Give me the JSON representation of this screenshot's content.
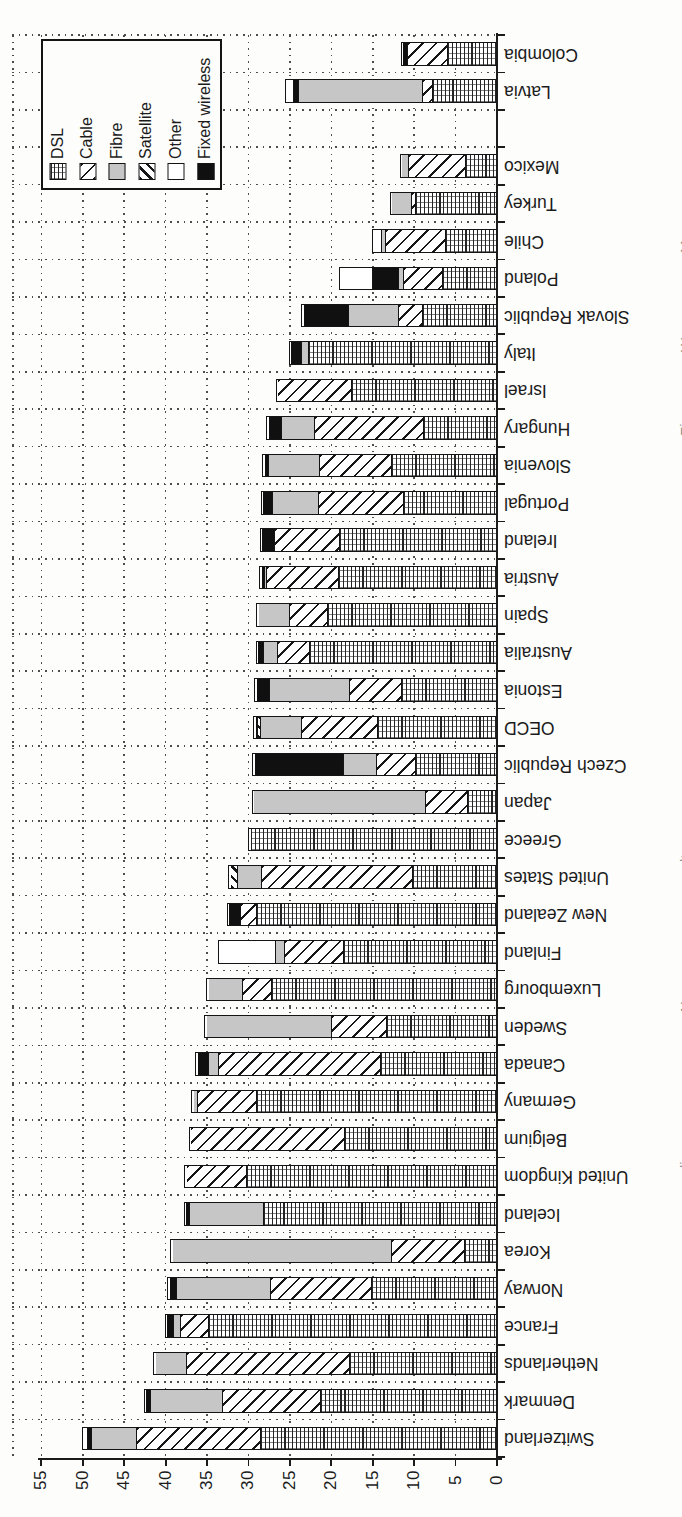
{
  "legend": {
    "entries": [
      {
        "label": "DSL",
        "key": "dsl"
      },
      {
        "label": "Cable",
        "key": "cable"
      },
      {
        "label": "Fibre",
        "key": "fibre"
      },
      {
        "label": "Satellite",
        "key": "satellite"
      },
      {
        "label": "Other",
        "key": "other"
      },
      {
        "label": "Fixed wireless",
        "key": "fixed_wireless"
      }
    ]
  },
  "value_axis": {
    "min": 0,
    "max": 55,
    "tick_step": 5,
    "tick_labels": [
      "55",
      "50",
      "45",
      "40",
      "35",
      "30",
      "25",
      "20",
      "15",
      "10",
      "5",
      "0"
    ]
  },
  "chart_data": {
    "type": "bar",
    "stacked": true,
    "orientation": "rotated-90ccw (bars extend left from right baseline, countries top-to-bottom)",
    "grid": "dotted, both axes",
    "legend_position": "top-left box",
    "series_order": [
      "dsl",
      "cable",
      "fibre",
      "satellite",
      "fixed_wireless",
      "other"
    ],
    "rows": [
      {
        "label": "Colombia",
        "segments": {
          "dsl": 5.8,
          "cable": 4.8,
          "fibre": 0,
          "satellite": 0,
          "fixed_wireless": 0.6,
          "other": 0
        }
      },
      {
        "label": "Latvia",
        "segments": {
          "dsl": 7.6,
          "cable": 1.2,
          "fibre": 15.0,
          "satellite": 0,
          "fixed_wireless": 0.6,
          "other": 0.8
        }
      },
      {
        "gap": true,
        "label": ""
      },
      {
        "label": "Mexico",
        "segments": {
          "dsl": 3.6,
          "cable": 6.9,
          "fibre": 0.8,
          "satellite": 0,
          "fixed_wireless": 0,
          "other": 0
        }
      },
      {
        "label": "Turkey",
        "segments": {
          "dsl": 9.6,
          "cable": 0.6,
          "fibre": 2.3,
          "satellite": 0,
          "fixed_wireless": 0,
          "other": 0
        }
      },
      {
        "label": "Chile",
        "segments": {
          "dsl": 6.0,
          "cable": 7.3,
          "fibre": 0.5,
          "satellite": 0,
          "fixed_wireless": 0,
          "other": 0.8
        }
      },
      {
        "label": "Poland",
        "segments": {
          "dsl": 6.4,
          "cable": 4.7,
          "fibre": 0.6,
          "satellite": 0,
          "fixed_wireless": 3.1,
          "other": 3.9
        }
      },
      {
        "label": "Slovak Republic",
        "segments": {
          "dsl": 8.8,
          "cable": 2.9,
          "fibre": 6.0,
          "satellite": 0,
          "fixed_wireless": 5.5,
          "other": 0
        }
      },
      {
        "label": "Italy",
        "segments": {
          "dsl": 22.6,
          "cable": 0,
          "fibre": 0.8,
          "satellite": 0,
          "fixed_wireless": 1.3,
          "other": 0
        }
      },
      {
        "label": "Israel",
        "segments": {
          "dsl": 17.4,
          "cable": 8.9,
          "fibre": 0,
          "satellite": 0,
          "fixed_wireless": 0,
          "other": 0
        }
      },
      {
        "label": "Hungary",
        "segments": {
          "dsl": 8.7,
          "cable": 13.2,
          "fibre": 3.9,
          "satellite": 0,
          "fixed_wireless": 1.6,
          "other": 0
        }
      },
      {
        "label": "Slovenia",
        "segments": {
          "dsl": 12.6,
          "cable": 8.7,
          "fibre": 6.1,
          "satellite": 0,
          "fixed_wireless": 0.5,
          "other": 0
        }
      },
      {
        "label": "Portugal",
        "segments": {
          "dsl": 11.1,
          "cable": 10.3,
          "fibre": 5.5,
          "satellite": 0,
          "fixed_wireless": 1.2,
          "other": 0
        }
      },
      {
        "label": "Ireland",
        "segments": {
          "dsl": 18.8,
          "cable": 7.9,
          "fibre": 0,
          "satellite": 0,
          "fixed_wireless": 1.5,
          "other": 0
        }
      },
      {
        "label": "Austria",
        "segments": {
          "dsl": 18.9,
          "cable": 8.7,
          "fibre": 0.3,
          "satellite": 0,
          "fixed_wireless": 0.4,
          "other": 0
        }
      },
      {
        "label": "Spain",
        "segments": {
          "dsl": 20.3,
          "cable": 4.6,
          "fibre": 3.7,
          "satellite": 0,
          "fixed_wireless": 0,
          "other": 0
        }
      },
      {
        "label": "Australia",
        "segments": {
          "dsl": 22.4,
          "cable": 3.9,
          "fibre": 1.7,
          "satellite": 0,
          "fixed_wireless": 0.7,
          "other": 0
        }
      },
      {
        "label": "Estonia",
        "segments": {
          "dsl": 11.3,
          "cable": 6.3,
          "fibre": 9.7,
          "satellite": 0,
          "fixed_wireless": 1.6,
          "other": 0
        }
      },
      {
        "label": "OECD",
        "segments": {
          "dsl": 14.2,
          "cable": 9.2,
          "fibre": 5.0,
          "satellite": 0.3,
          "fixed_wireless": 0.3,
          "other": 0
        }
      },
      {
        "label": "Czech Republic",
        "segments": {
          "dsl": 9.7,
          "cable": 4.7,
          "fibre": 3.9,
          "satellite": 0,
          "fixed_wireless": 10.8,
          "other": 0
        }
      },
      {
        "label": "Japan",
        "segments": {
          "dsl": 3.4,
          "cable": 5.0,
          "fibre": 20.8,
          "satellite": 0,
          "fixed_wireless": 0,
          "other": 0
        }
      },
      {
        "label": "Greece",
        "segments": {
          "dsl": 29.6,
          "cable": 0,
          "fibre": 0,
          "satellite": 0,
          "fixed_wireless": 0,
          "other": 0
        }
      },
      {
        "label": "United States",
        "segments": {
          "dsl": 10.0,
          "cable": 18.2,
          "fibre": 3.0,
          "satellite": 0.8,
          "fixed_wireless": 0,
          "other": 0
        }
      },
      {
        "label": "New Zealand",
        "segments": {
          "dsl": 28.9,
          "cable": 1.9,
          "fibre": 0,
          "satellite": 0,
          "fixed_wireless": 1.4,
          "other": 0
        }
      },
      {
        "label": "Finland",
        "segments": {
          "dsl": 18.4,
          "cable": 7.1,
          "fibre": 1.1,
          "satellite": 0,
          "fixed_wireless": 0,
          "other": 6.7
        }
      },
      {
        "label": "Luxembourg",
        "segments": {
          "dsl": 27.1,
          "cable": 3.4,
          "fibre": 4.2,
          "satellite": 0,
          "fixed_wireless": 0,
          "other": 0
        }
      },
      {
        "label": "Sweden",
        "segments": {
          "dsl": 13.2,
          "cable": 6.6,
          "fibre": 15.1,
          "satellite": 0,
          "fixed_wireless": 0,
          "other": 0
        }
      },
      {
        "label": "Canada",
        "segments": {
          "dsl": 13.9,
          "cable": 19.5,
          "fibre": 1.3,
          "satellite": 0,
          "fixed_wireless": 1.3,
          "other": 0
        }
      },
      {
        "label": "Germany",
        "segments": {
          "dsl": 28.9,
          "cable": 7.1,
          "fibre": 0.5,
          "satellite": 0,
          "fixed_wireless": 0,
          "other": 0
        }
      },
      {
        "label": "Belgium",
        "segments": {
          "dsl": 18.2,
          "cable": 18.6,
          "fibre": 0,
          "satellite": 0,
          "fixed_wireless": 0,
          "other": 0
        }
      },
      {
        "label": "United Kingdom",
        "segments": {
          "dsl": 30.0,
          "cable": 7.3,
          "fibre": 0,
          "satellite": 0,
          "fixed_wireless": 0,
          "other": 0
        }
      },
      {
        "label": "Iceland",
        "segments": {
          "dsl": 28.0,
          "cable": 0,
          "fibre": 8.9,
          "satellite": 0,
          "fixed_wireless": 0.5,
          "other": 0
        }
      },
      {
        "label": "Korea",
        "segments": {
          "dsl": 3.7,
          "cable": 8.9,
          "fibre": 26.4,
          "satellite": 0,
          "fixed_wireless": 0,
          "other": 0
        }
      },
      {
        "label": "Norway",
        "segments": {
          "dsl": 15.0,
          "cable": 12.2,
          "fibre": 11.3,
          "satellite": 0,
          "fixed_wireless": 0.9,
          "other": 0
        }
      },
      {
        "label": "France",
        "segments": {
          "dsl": 34.7,
          "cable": 3.3,
          "fibre": 0.9,
          "satellite": 0,
          "fixed_wireless": 0.8,
          "other": 0
        }
      },
      {
        "label": "Netherlands",
        "segments": {
          "dsl": 17.6,
          "cable": 19.7,
          "fibre": 3.8,
          "satellite": 0,
          "fixed_wireless": 0,
          "other": 0
        }
      },
      {
        "label": "Denmark",
        "segments": {
          "dsl": 21.1,
          "cable": 11.8,
          "fibre": 8.7,
          "satellite": 0,
          "fixed_wireless": 0.6,
          "other": 0
        }
      },
      {
        "label": "Switzerland",
        "segments": {
          "dsl": 28.4,
          "cable": 15.0,
          "fibre": 5.4,
          "satellite": 0,
          "fixed_wireless": 0.4,
          "other": 0.5
        }
      }
    ]
  },
  "page_edge_fragments": [
    {
      "text": "≡",
      "y": 168
    },
    {
      "text": "M",
      "y": 253
    },
    {
      "text": "W",
      "y": 352
    },
    {
      "text": "Fi",
      "y": 436
    },
    {
      "text": "c",
      "y": 566
    },
    {
      "text": "lt",
      "y": 862
    },
    {
      "text": "N",
      "y": 1012
    },
    {
      "text": "li",
      "y": 1168
    },
    {
      "text": ".",
      "y": 1477
    }
  ]
}
